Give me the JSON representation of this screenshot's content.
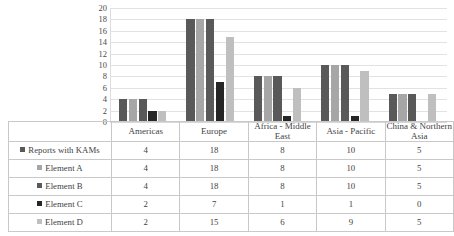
{
  "chart_data": {
    "type": "bar",
    "title": "",
    "xlabel": "",
    "ylabel": "",
    "ylim": [
      0,
      20
    ],
    "grid": true,
    "legend_position": "table-left",
    "categories": [
      "Americas",
      "Europe",
      "Africa - Middle East",
      "Asia - Pacific",
      "China & Northern Asia"
    ],
    "yticks": [
      "0",
      "2",
      "4",
      "6",
      "8",
      "10",
      "12",
      "14",
      "16",
      "18",
      "20"
    ],
    "series": [
      {
        "name": "Reports with KAMs",
        "color": "#595959",
        "values": [
          4,
          18,
          8,
          10,
          5
        ]
      },
      {
        "name": "Element A",
        "color": "#a6a6a6",
        "values": [
          4,
          18,
          8,
          10,
          5
        ]
      },
      {
        "name": "Element B",
        "color": "#595959",
        "values": [
          4,
          18,
          8,
          10,
          5
        ]
      },
      {
        "name": "Element C",
        "color": "#262626",
        "values": [
          2,
          7,
          1,
          1,
          0
        ]
      },
      {
        "name": "Element D",
        "color": "#bfbfbf",
        "values": [
          2,
          15,
          6,
          9,
          5
        ]
      }
    ]
  },
  "table": {
    "row_header_blank": "",
    "column_headers": [
      "Americas",
      "Europe",
      "Africa - Middle East",
      "Asia - Pacific",
      "China & Northern Asia"
    ],
    "rows": [
      {
        "label": "Reports with KAMs",
        "swatch": "#595959",
        "cells": [
          "4",
          "18",
          "8",
          "10",
          "5"
        ]
      },
      {
        "label": "Element A",
        "swatch": "#a6a6a6",
        "cells": [
          "4",
          "18",
          "8",
          "10",
          "5"
        ]
      },
      {
        "label": "Element B",
        "swatch": "#595959",
        "cells": [
          "4",
          "18",
          "8",
          "10",
          "5"
        ]
      },
      {
        "label": "Element C",
        "swatch": "#262626",
        "cells": [
          "2",
          "7",
          "1",
          "1",
          "0"
        ]
      },
      {
        "label": "Element D",
        "swatch": "#bfbfbf",
        "cells": [
          "2",
          "15",
          "6",
          "9",
          "5"
        ]
      }
    ]
  },
  "colors": {
    "gridline": "#e2e2e2",
    "table_border": "#c9c9c9",
    "text": "#3f3f3f"
  }
}
